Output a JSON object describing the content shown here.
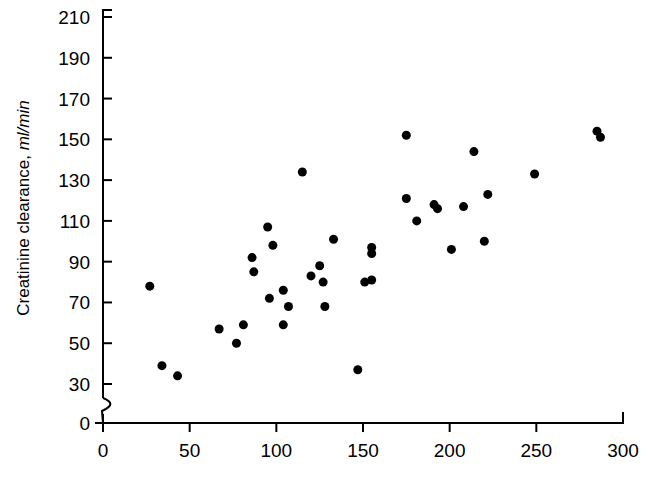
{
  "chart_data": {
    "type": "scatter",
    "title": "",
    "xlabel": "",
    "ylabel": "Creatinine clearance, ml/min",
    "ylabel_plain": "Creatinine clearance,",
    "ylabel_italic": "ml/min",
    "xlim": [
      0,
      300
    ],
    "ylim": [
      30,
      210
    ],
    "y_axis_break": true,
    "y_axis_origin_label": "0",
    "grid": false,
    "legend": null,
    "xticks": [
      0,
      50,
      100,
      150,
      200,
      250,
      300
    ],
    "xtick_labels": [
      "0",
      "50",
      "100",
      "150",
      "200",
      "250",
      "300"
    ],
    "yticks": [
      30,
      50,
      70,
      90,
      110,
      130,
      150,
      170,
      190,
      210
    ],
    "ytick_labels": [
      "30",
      "50",
      "70",
      "90",
      "110",
      "130",
      "150",
      "170",
      "190",
      "210"
    ],
    "marker": "filled-circle",
    "marker_color": "#000000",
    "marker_size": 9,
    "points": [
      {
        "x": 27,
        "y": 78
      },
      {
        "x": 34,
        "y": 39
      },
      {
        "x": 43,
        "y": 34
      },
      {
        "x": 67,
        "y": 57
      },
      {
        "x": 77,
        "y": 50
      },
      {
        "x": 81,
        "y": 59
      },
      {
        "x": 86,
        "y": 92
      },
      {
        "x": 87,
        "y": 85
      },
      {
        "x": 95,
        "y": 107
      },
      {
        "x": 96,
        "y": 72
      },
      {
        "x": 98,
        "y": 98
      },
      {
        "x": 104,
        "y": 76
      },
      {
        "x": 104,
        "y": 59
      },
      {
        "x": 107,
        "y": 68
      },
      {
        "x": 115,
        "y": 134
      },
      {
        "x": 120,
        "y": 83
      },
      {
        "x": 125,
        "y": 88
      },
      {
        "x": 127,
        "y": 80
      },
      {
        "x": 128,
        "y": 68
      },
      {
        "x": 133,
        "y": 101
      },
      {
        "x": 147,
        "y": 37
      },
      {
        "x": 151,
        "y": 80
      },
      {
        "x": 155,
        "y": 97
      },
      {
        "x": 155,
        "y": 94
      },
      {
        "x": 155,
        "y": 81
      },
      {
        "x": 175,
        "y": 152
      },
      {
        "x": 175,
        "y": 121
      },
      {
        "x": 181,
        "y": 110
      },
      {
        "x": 191,
        "y": 118
      },
      {
        "x": 193,
        "y": 116
      },
      {
        "x": 201,
        "y": 96
      },
      {
        "x": 208,
        "y": 117
      },
      {
        "x": 214,
        "y": 144
      },
      {
        "x": 220,
        "y": 100
      },
      {
        "x": 222,
        "y": 123
      },
      {
        "x": 249,
        "y": 133
      },
      {
        "x": 285,
        "y": 154
      },
      {
        "x": 287,
        "y": 151
      }
    ]
  },
  "colors": {
    "axis": "#000000",
    "marker": "#000000",
    "background": "#ffffff"
  }
}
